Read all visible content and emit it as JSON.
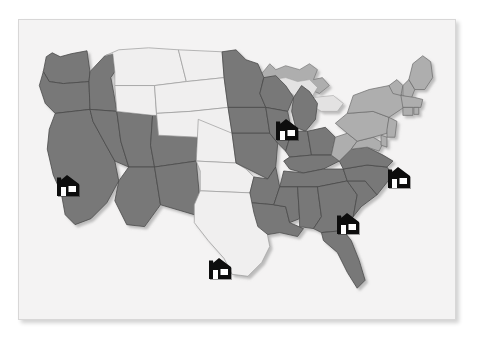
{
  "panel": {
    "title": "United States Location Map",
    "background_color": "#f4f3f3",
    "border_color": "#d8d7d7"
  },
  "map": {
    "name": "usa-states-map",
    "projection": "albers-usa",
    "colors": {
      "highlighted_state": "#787878",
      "plain_state": "#f0efef",
      "secondary_state": "#aeaeae",
      "water": "#e3e2e2",
      "state_border": "#4a4a4a",
      "outline": "#6b6b6b",
      "marker_fill": "#0d0d0d",
      "marker_window": "#ffffff"
    },
    "legend_present": false,
    "labels_present": false
  },
  "states": [
    {
      "code": "WA",
      "name": "Washington",
      "shade": "highlighted"
    },
    {
      "code": "OR",
      "name": "Oregon",
      "shade": "highlighted"
    },
    {
      "code": "CA",
      "name": "California",
      "shade": "highlighted"
    },
    {
      "code": "NV",
      "name": "Nevada",
      "shade": "highlighted"
    },
    {
      "code": "ID",
      "name": "Idaho",
      "shade": "highlighted"
    },
    {
      "code": "UT",
      "name": "Utah",
      "shade": "highlighted"
    },
    {
      "code": "AZ",
      "name": "Arizona",
      "shade": "highlighted"
    },
    {
      "code": "CO",
      "name": "Colorado",
      "shade": "highlighted"
    },
    {
      "code": "NM",
      "name": "New Mexico",
      "shade": "highlighted"
    },
    {
      "code": "MT",
      "name": "Montana",
      "shade": "plain"
    },
    {
      "code": "WY",
      "name": "Wyoming",
      "shade": "plain"
    },
    {
      "code": "ND",
      "name": "North Dakota",
      "shade": "plain"
    },
    {
      "code": "SD",
      "name": "South Dakota",
      "shade": "plain"
    },
    {
      "code": "NE",
      "name": "Nebraska",
      "shade": "plain"
    },
    {
      "code": "KS",
      "name": "Kansas",
      "shade": "plain"
    },
    {
      "code": "OK",
      "name": "Oklahoma",
      "shade": "plain"
    },
    {
      "code": "TX",
      "name": "Texas",
      "shade": "plain"
    },
    {
      "code": "MN",
      "name": "Minnesota",
      "shade": "highlighted"
    },
    {
      "code": "IA",
      "name": "Iowa",
      "shade": "highlighted"
    },
    {
      "code": "MO",
      "name": "Missouri",
      "shade": "highlighted"
    },
    {
      "code": "AR",
      "name": "Arkansas",
      "shade": "highlighted"
    },
    {
      "code": "LA",
      "name": "Louisiana",
      "shade": "highlighted"
    },
    {
      "code": "WI",
      "name": "Wisconsin",
      "shade": "highlighted"
    },
    {
      "code": "IL",
      "name": "Illinois",
      "shade": "highlighted"
    },
    {
      "code": "MI",
      "name": "Michigan",
      "shade": "highlighted"
    },
    {
      "code": "IN",
      "name": "Indiana",
      "shade": "highlighted"
    },
    {
      "code": "OH",
      "name": "Ohio",
      "shade": "highlighted"
    },
    {
      "code": "KY",
      "name": "Kentucky",
      "shade": "highlighted"
    },
    {
      "code": "TN",
      "name": "Tennessee",
      "shade": "highlighted"
    },
    {
      "code": "MS",
      "name": "Mississippi",
      "shade": "highlighted"
    },
    {
      "code": "AL",
      "name": "Alabama",
      "shade": "highlighted"
    },
    {
      "code": "GA",
      "name": "Georgia",
      "shade": "highlighted"
    },
    {
      "code": "FL",
      "name": "Florida",
      "shade": "highlighted"
    },
    {
      "code": "SC",
      "name": "South Carolina",
      "shade": "highlighted"
    },
    {
      "code": "NC",
      "name": "North Carolina",
      "shade": "highlighted"
    },
    {
      "code": "VA",
      "name": "Virginia",
      "shade": "highlighted"
    },
    {
      "code": "WV",
      "name": "West Virginia",
      "shade": "secondary"
    },
    {
      "code": "MD",
      "name": "Maryland",
      "shade": "secondary"
    },
    {
      "code": "DE",
      "name": "Delaware",
      "shade": "secondary"
    },
    {
      "code": "PA",
      "name": "Pennsylvania",
      "shade": "secondary"
    },
    {
      "code": "NJ",
      "name": "New Jersey",
      "shade": "secondary"
    },
    {
      "code": "NY",
      "name": "New York",
      "shade": "secondary"
    },
    {
      "code": "CT",
      "name": "Connecticut",
      "shade": "secondary"
    },
    {
      "code": "RI",
      "name": "Rhode Island",
      "shade": "secondary"
    },
    {
      "code": "MA",
      "name": "Massachusetts",
      "shade": "secondary"
    },
    {
      "code": "VT",
      "name": "Vermont",
      "shade": "secondary"
    },
    {
      "code": "NH",
      "name": "New Hampshire",
      "shade": "secondary"
    },
    {
      "code": "ME",
      "name": "Maine",
      "shade": "secondary"
    }
  ],
  "markers": [
    {
      "id": "marker-california",
      "label": "California location",
      "icon": "house-icon",
      "x": 33,
      "y": 152,
      "state": "CA"
    },
    {
      "id": "marker-illinois",
      "label": "Illinois location",
      "icon": "house-icon",
      "x": 252,
      "y": 96,
      "state": "IL"
    },
    {
      "id": "marker-virginia",
      "label": "Virginia location",
      "icon": "house-icon",
      "x": 364,
      "y": 144,
      "state": "VA"
    },
    {
      "id": "marker-georgia",
      "label": "Georgia location",
      "icon": "house-icon",
      "x": 313,
      "y": 190,
      "state": "GA"
    },
    {
      "id": "marker-texas",
      "label": "Texas location",
      "icon": "house-icon",
      "x": 185,
      "y": 235,
      "state": "TX"
    }
  ],
  "marker_count": 5
}
